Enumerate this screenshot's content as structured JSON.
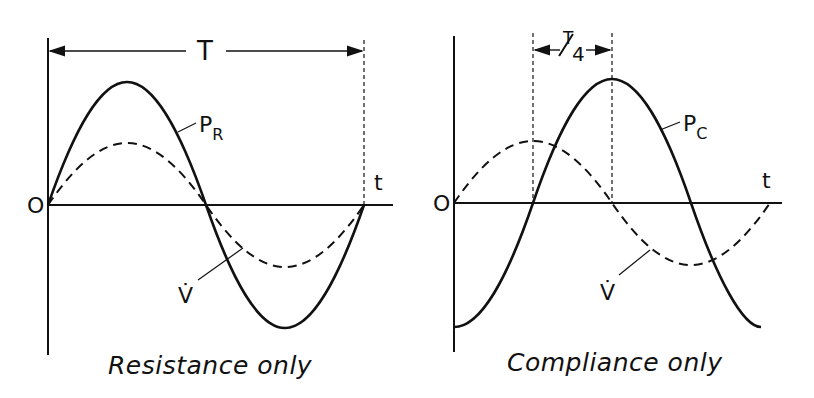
{
  "panels": [
    {
      "id": "resistance",
      "caption": "Resistance only",
      "origin_label": "O",
      "time_axis_label": "t",
      "period_label": "T",
      "pressure_label_main": "P",
      "pressure_label_sub": "R",
      "flow_label": "V̇",
      "description": "Pressure P_R (solid) in phase with flow V̇ (dashed) over one period T"
    },
    {
      "id": "compliance",
      "caption": "Compliance only",
      "origin_label": "O",
      "time_axis_label": "t",
      "phase_shift_label_num": "T",
      "phase_shift_label_den": "4",
      "pressure_label_main": "P",
      "pressure_label_sub": "C",
      "flow_label": "V̇",
      "description": "Pressure P_C (solid) lags flow V̇ (dashed) by a quarter period T/4"
    }
  ],
  "style": {
    "stroke": "#111111",
    "background": "#ffffff"
  }
}
